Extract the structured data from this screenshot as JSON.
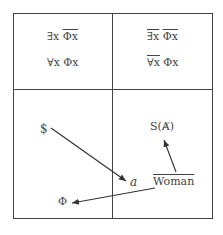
{
  "quadrants": {
    "top_left": {
      "line1": {
        "quantifier": "∃x",
        "predicate": "Φx",
        "predicate_overlined": true,
        "quantifier_overlined": false
      },
      "line2": {
        "quantifier": "∀x",
        "predicate": "Φx",
        "predicate_overlined": false,
        "quantifier_overlined": false
      }
    },
    "top_right": {
      "line1": {
        "quantifier": "∃x",
        "predicate": "Φx",
        "predicate_overlined": true,
        "quantifier_overlined": true
      },
      "line2": {
        "quantifier": "∀x",
        "predicate": "Φx",
        "predicate_overlined": false,
        "quantifier_overlined": true
      }
    }
  },
  "bottom_labels": {
    "barred_subject": "$",
    "phi": "Φ",
    "object_a": "a",
    "signifier_barred_A": "S(Ⱥ)",
    "woman": "Woman",
    "woman_prefix_barred": "The"
  },
  "arrows": [
    {
      "from": "barred_subject",
      "to": "object_a"
    },
    {
      "from": "woman",
      "to": "signifier_barred_A"
    },
    {
      "from": "woman",
      "to": "phi"
    }
  ],
  "colors": {
    "line": "#444444",
    "text": "#444444",
    "background": "#ffffff"
  }
}
